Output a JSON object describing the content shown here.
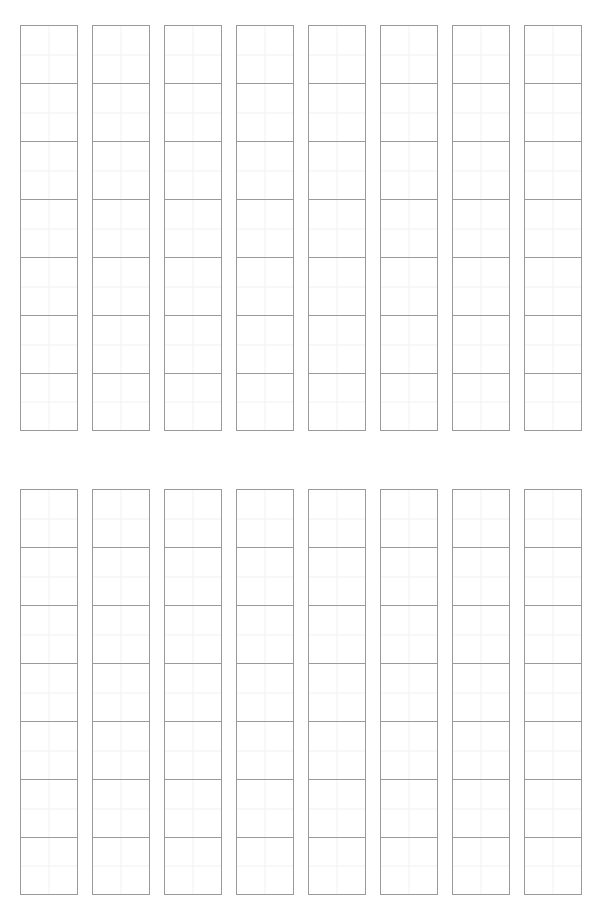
{
  "page": {
    "background_color": "#ffffff",
    "width_px": 601,
    "height_px": 921
  },
  "style": {
    "block_border_color": "#9a9a9a",
    "cell_divider_color": "#f1f1f1",
    "cell_background_color": "#ffffff"
  },
  "layout": {
    "section_count": 2,
    "columns_per_section": 8,
    "blocks_per_column": 7,
    "cells_per_block": 4,
    "block_size_px": 58,
    "column_gap_px": 14,
    "section_top_y_px": 25,
    "section_bottom_y_px": 489,
    "left_margin_px": 20
  },
  "sections": [
    {
      "name": "top-grid-section",
      "columns": [
        {
          "label": "column-1",
          "blocks": [
            "",
            "",
            "",
            "",
            "",
            "",
            ""
          ]
        },
        {
          "label": "column-2",
          "blocks": [
            "",
            "",
            "",
            "",
            "",
            "",
            ""
          ]
        },
        {
          "label": "column-3",
          "blocks": [
            "",
            "",
            "",
            "",
            "",
            "",
            ""
          ]
        },
        {
          "label": "column-4",
          "blocks": [
            "",
            "",
            "",
            "",
            "",
            "",
            ""
          ]
        },
        {
          "label": "column-5",
          "blocks": [
            "",
            "",
            "",
            "",
            "",
            "",
            ""
          ]
        },
        {
          "label": "column-6",
          "blocks": [
            "",
            "",
            "",
            "",
            "",
            "",
            ""
          ]
        },
        {
          "label": "column-7",
          "blocks": [
            "",
            "",
            "",
            "",
            "",
            "",
            ""
          ]
        },
        {
          "label": "column-8",
          "blocks": [
            "",
            "",
            "",
            "",
            "",
            "",
            ""
          ]
        }
      ]
    },
    {
      "name": "bottom-grid-section",
      "columns": [
        {
          "label": "column-1",
          "blocks": [
            "",
            "",
            "",
            "",
            "",
            "",
            ""
          ]
        },
        {
          "label": "column-2",
          "blocks": [
            "",
            "",
            "",
            "",
            "",
            "",
            ""
          ]
        },
        {
          "label": "column-3",
          "blocks": [
            "",
            "",
            "",
            "",
            "",
            "",
            ""
          ]
        },
        {
          "label": "column-4",
          "blocks": [
            "",
            "",
            "",
            "",
            "",
            "",
            ""
          ]
        },
        {
          "label": "column-5",
          "blocks": [
            "",
            "",
            "",
            "",
            "",
            "",
            ""
          ]
        },
        {
          "label": "column-6",
          "blocks": [
            "",
            "",
            "",
            "",
            "",
            "",
            ""
          ]
        },
        {
          "label": "column-7",
          "blocks": [
            "",
            "",
            "",
            "",
            "",
            "",
            ""
          ]
        },
        {
          "label": "column-8",
          "blocks": [
            "",
            "",
            "",
            "",
            "",
            "",
            ""
          ]
        }
      ]
    }
  ]
}
